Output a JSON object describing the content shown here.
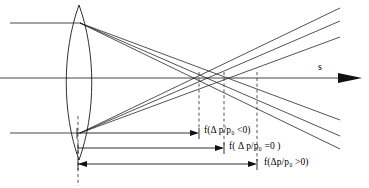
{
  "figure": {
    "type": "optics-ray-diagram",
    "width": 369,
    "height": 188,
    "background_color": "#ffffff",
    "line_color": "#1a1a1a"
  },
  "axis": {
    "label": "s",
    "label_x": 320,
    "label_y": 62,
    "y": 78,
    "x_start": 0,
    "x_end": 360,
    "arrowhead": "solid-right"
  },
  "lens": {
    "name": "biconvex-lens",
    "center_x": 79,
    "top_y": 5,
    "bottom_y": 160,
    "half_width": 14
  },
  "incoming_rays": [
    {
      "name": "ray-top",
      "y": 23,
      "x_start": 10,
      "x_end": 80
    },
    {
      "name": "ray-axis",
      "y": 78,
      "x_start": 0,
      "x_end": 80
    },
    {
      "name": "ray-bottom",
      "y": 133,
      "x_start": 10,
      "x_end": 80
    }
  ],
  "focal_points": [
    {
      "name": "focus-negative",
      "x": 199,
      "y": 78,
      "condition": "<0"
    },
    {
      "name": "focus-zero",
      "x": 224,
      "y": 78,
      "condition": "=0"
    },
    {
      "name": "focus-positive",
      "x": 257,
      "y": 78,
      "condition": ">0"
    }
  ],
  "dashed_verticals": [
    {
      "name": "dashed-focus-negative",
      "x": 199,
      "y_top": 78,
      "y_bottom": 130
    },
    {
      "name": "dashed-focus-zero",
      "x": 224,
      "y_top": 78,
      "y_bottom": 146
    },
    {
      "name": "dashed-focus-positive",
      "x": 257,
      "y_top": 78,
      "y_bottom": 162
    },
    {
      "name": "dashed-lens-center",
      "x": 78,
      "y_top": 118,
      "y_bottom": 186
    }
  ],
  "measurements": [
    {
      "name": "measure-negative",
      "y": 133,
      "x_start": 77,
      "x_end": 199,
      "label": "f(Δ p/p₀ <0)",
      "label_parts": {
        "prefix": "f(",
        "delta": "Δ",
        "ratio": " p/p",
        "sub": "0",
        "comparison": " <0",
        "suffix": ")"
      },
      "label_x": 204,
      "label_y": 127
    },
    {
      "name": "measure-zero",
      "y": 148,
      "x_start": 78,
      "x_end": 224,
      "label": "f( Δ p/p₀ =0 )",
      "label_parts": {
        "prefix": "f( ",
        "delta": "Δ",
        "ratio": " p/p",
        "sub": "0",
        "comparison": " =0 ",
        "suffix": ")"
      },
      "label_x": 230,
      "label_y": 143
    },
    {
      "name": "measure-positive",
      "y": 164,
      "x_start": 78,
      "x_end": 257,
      "label": "f(Δp/p₀ >0)",
      "label_parts": {
        "prefix": "f(",
        "delta": "Δ",
        "ratio": "p/p",
        "sub": "0",
        "comparison": " >0",
        "suffix": ")"
      },
      "label_x": 265,
      "label_y": 159
    }
  ],
  "labels": {
    "measure_negative_full": "f(Δ p/p₀ <0)",
    "measure_zero_full": "f( Δ p/p₀ =0 )",
    "measure_positive_full": "f(Δp/p₀ >0)",
    "axis_s": "s"
  },
  "ray_fan": {
    "upper_origin": {
      "x": 80,
      "y": 23
    },
    "lower_origin": {
      "x": 80,
      "y": 133
    },
    "right_edge_x": 340,
    "count_per_fan": 3
  }
}
